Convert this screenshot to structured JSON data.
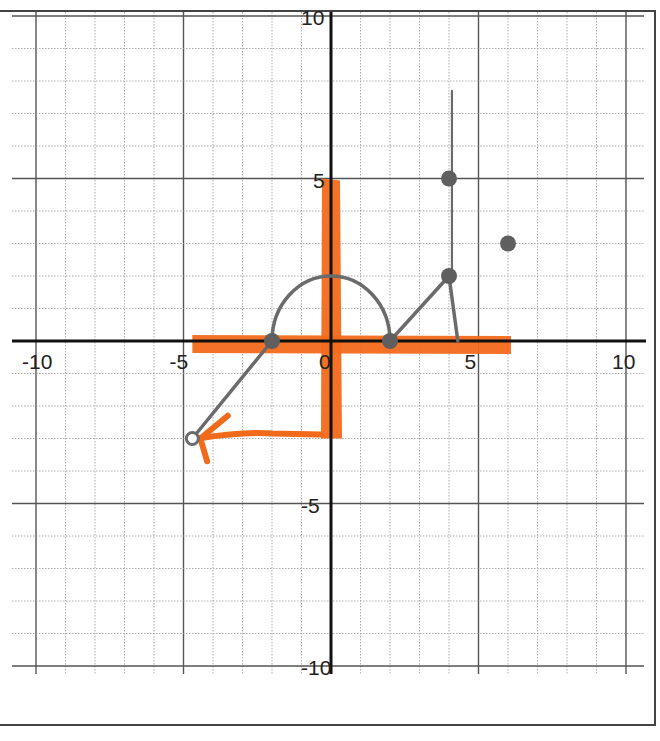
{
  "chart_data": {
    "type": "scatter",
    "title": "",
    "xlabel": "",
    "ylabel": "",
    "xlim": [
      -10,
      10
    ],
    "ylim": [
      -10,
      10
    ],
    "grid": true,
    "grid_minor_step": 1,
    "grid_major_step": 5,
    "x_tick_labels": [
      "-10",
      "-5",
      "0",
      "5",
      "10"
    ],
    "y_tick_labels": [
      "10",
      "5",
      "-5",
      "-10"
    ],
    "colors": {
      "graph": "#6b6b6b",
      "highlight": "#f26a1b",
      "axis": "#111111",
      "grid": "#9a9a9a"
    },
    "series": [
      {
        "name": "segment from open point to x-intercept",
        "kind": "line",
        "points": [
          [
            -4.7,
            -3
          ],
          [
            -2,
            0
          ]
        ],
        "open_start": true
      },
      {
        "name": "semicircle",
        "kind": "arc",
        "center": [
          0,
          0
        ],
        "radius": 2,
        "points": [
          [
            -2,
            0
          ],
          [
            0,
            2
          ],
          [
            2,
            0
          ]
        ]
      },
      {
        "name": "segment rising to (4,2)",
        "kind": "line",
        "points": [
          [
            2,
            0
          ],
          [
            4,
            2
          ]
        ]
      },
      {
        "name": "segment falling to x-axis",
        "kind": "line",
        "points": [
          [
            4,
            2
          ],
          [
            4.3,
            0
          ]
        ]
      },
      {
        "name": "vertical line",
        "kind": "line",
        "points": [
          [
            4.1,
            1.8
          ],
          [
            4.1,
            7.7
          ]
        ]
      },
      {
        "name": "closed points",
        "kind": "points",
        "points": [
          [
            -2,
            0
          ],
          [
            2,
            0
          ],
          [
            4,
            2
          ],
          [
            4,
            5
          ],
          [
            6,
            3
          ]
        ]
      },
      {
        "name": "open point",
        "kind": "points",
        "points": [
          [
            -4.7,
            -3
          ]
        ],
        "open": true
      }
    ],
    "annotations": [
      {
        "name": "orange horizontal highlight (domain)",
        "from": [
          -4.7,
          0
        ],
        "to": [
          6.1,
          0
        ]
      },
      {
        "name": "orange vertical highlight (range)",
        "from": [
          0,
          5
        ],
        "to": [
          0,
          -3
        ]
      },
      {
        "name": "orange arrow",
        "from": [
          0,
          -3
        ],
        "to": [
          -4.7,
          -3
        ]
      }
    ]
  }
}
